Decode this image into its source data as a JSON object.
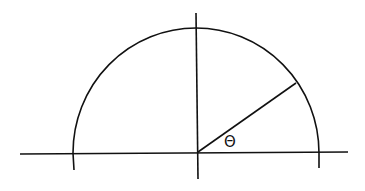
{
  "diagram": {
    "type": "semicircle-angle",
    "angle_label": "Θ",
    "stroke_color": "#111111",
    "background": "#ffffff"
  }
}
